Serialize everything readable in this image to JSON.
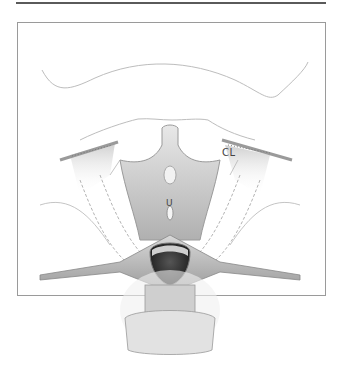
{
  "figure": {
    "labels": {
      "cl": "CL",
      "u": "U"
    },
    "colors": {
      "rule": "#5a5a5a",
      "frame_border": "#9a9a9a",
      "outline": "#b8b8b8",
      "tissue_light": "#e4e4e4",
      "tissue_mid": "#c4c4c4",
      "tissue_dark": "#8a8a8a",
      "cavity": "#2a2a2a"
    }
  }
}
